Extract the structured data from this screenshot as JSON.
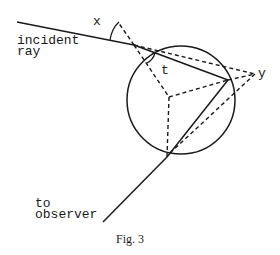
{
  "figure": {
    "caption": "Fig. 3",
    "labels": {
      "x": "x",
      "t": "t",
      "y": "y",
      "incident": "incident",
      "ray": "ray",
      "to": "to",
      "observer": "observer"
    },
    "colors": {
      "ink": "#1a1a1a",
      "background": "#ffffff"
    }
  }
}
